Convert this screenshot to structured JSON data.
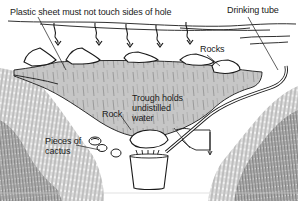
{
  "diagram": {
    "labels": {
      "plastic_sheet": "Plastic sheet must not touch sides of hole",
      "drinking_tube": "Drinking tube",
      "rocks": "Rocks",
      "rock": "Rock",
      "trough": "Trough holds\nundistilled\nwater",
      "cactus": "Pieces of\ncactus"
    },
    "elements": [
      {
        "name": "ground-surface-line"
      },
      {
        "name": "rain-arrow",
        "count": 5
      },
      {
        "name": "rim-rocks",
        "count": 5
      },
      {
        "name": "plastic-sheet"
      },
      {
        "name": "center-rock"
      },
      {
        "name": "collection-bucket"
      },
      {
        "name": "drinking-tube"
      },
      {
        "name": "cactus-pieces"
      },
      {
        "name": "trough"
      },
      {
        "name": "soil-hatching"
      }
    ],
    "colors": {
      "sheet_fill": "#c9c9c9",
      "ink": "#1a1a1a",
      "soil": "#7a7a7a",
      "background": "#ffffff"
    }
  }
}
